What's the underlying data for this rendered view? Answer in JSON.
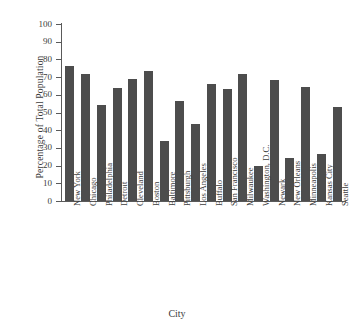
{
  "chart_data": {
    "type": "bar",
    "title": "",
    "xlabel": "City",
    "ylabel": "Percentage of  Total Population",
    "ylim": [
      0,
      100
    ],
    "yticks": [
      0,
      10,
      20,
      30,
      40,
      50,
      60,
      70,
      80,
      90,
      100
    ],
    "grid": false,
    "legend": null,
    "bar_color": "#4d4d4d",
    "axis_color": "#5a5a5a",
    "categories": [
      "New York",
      "Chicago",
      "Philadelphia",
      "Detroit",
      "Cleveland",
      "Boston",
      "Baltimore",
      "Pittsburgh",
      "Los Angeles",
      "Buffalo",
      "San Francisco",
      "Milwaukee",
      "Washington, D.C.",
      "Newark",
      "New Orleans",
      "Minneapolis",
      "Kansas City",
      "Seattle"
    ],
    "values": [
      76,
      72,
      54.5,
      64,
      69,
      73.5,
      34,
      56.5,
      43.5,
      66,
      63.5,
      71.5,
      20,
      68.5,
      24.5,
      64.5,
      26.5,
      53
    ]
  }
}
